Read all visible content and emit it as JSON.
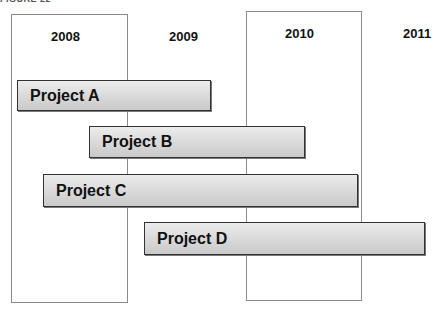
{
  "figure_label": "FIGURE 22",
  "years": [
    {
      "label": "2008",
      "boxed": true
    },
    {
      "label": "2009",
      "boxed": false
    },
    {
      "label": "2010",
      "boxed": true
    },
    {
      "label": "2011",
      "boxed": false
    }
  ],
  "projects": [
    {
      "label": "Project A",
      "start": "early 2008",
      "end": "early 2009"
    },
    {
      "label": "Project B",
      "start": "mid 2008",
      "end": "mid 2010"
    },
    {
      "label": "Project C",
      "start": "early 2008",
      "end": "end 2010"
    },
    {
      "label": "Project D",
      "start": "start 2009",
      "end": "mid 2011"
    }
  ],
  "colors": {
    "bar_top": "#ececec",
    "bar_bottom": "#c9c9c9",
    "bar_border": "#333333",
    "box_border": "#8a8a8a"
  }
}
